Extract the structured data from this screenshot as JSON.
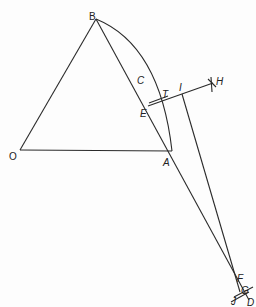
{
  "diagram": {
    "points": {
      "O": {
        "label": "O",
        "x": 20,
        "y": 150
      },
      "A": {
        "label": "A",
        "x": 172,
        "y": 151
      },
      "B": {
        "label": "B",
        "x": 96,
        "y": 19
      },
      "C": {
        "label": "C"
      },
      "E": {
        "label": "E",
        "x": 148,
        "y": 106
      },
      "T": {
        "label": "T"
      },
      "I": {
        "label": "I"
      },
      "H": {
        "label": "H",
        "x": 213,
        "y": 83
      },
      "F": {
        "label": "F"
      },
      "G": {
        "label": "G"
      },
      "D": {
        "label": "D"
      },
      "J": {
        "label": "J"
      }
    },
    "line_color": "#2a2a2a"
  }
}
